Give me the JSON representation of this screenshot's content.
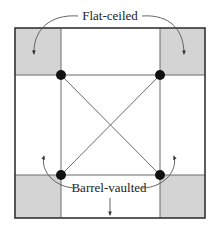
{
  "diagram": {
    "labels": {
      "top": "Flat-ceiled",
      "bottom": "Barrel-vaulted"
    },
    "colors": {
      "background": "#ffffff",
      "shade": "#d4d4d4",
      "outline": "#3a3a3a",
      "inner_line": "#7a7a7a",
      "dot": "#111111",
      "arrow": "#444444"
    },
    "regions": {
      "corners_shaded": [
        "top-left",
        "top-right",
        "bottom-left",
        "bottom-right"
      ],
      "supports": 4
    }
  }
}
